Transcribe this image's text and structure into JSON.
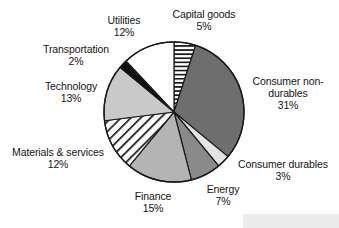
{
  "chart_data": {
    "type": "pie",
    "title": "",
    "subtitle": "",
    "xlabel": "",
    "ylabel": "",
    "grid": false,
    "legend_position": "none",
    "label_format": "name + percent outside slice",
    "start_angle_deg": 0,
    "direction": "clockwise",
    "categories": [
      "Capital goods",
      "Consumer non-durables",
      "Consumer durables",
      "Energy",
      "Finance",
      "Materials & services",
      "Technology",
      "Transportation",
      "Utilities"
    ],
    "values": [
      5,
      31,
      3,
      7,
      15,
      12,
      13,
      2,
      12
    ],
    "units": "%",
    "slices": [
      {
        "name": "Capital goods",
        "label_line1": "Capital goods",
        "label_line2": "5%",
        "value": 5,
        "fill": "horizontal-stripes",
        "color": "#ffffff",
        "stripe_color": "#1a1a1a"
      },
      {
        "name": "Consumer non-durables",
        "label_line1": "Consumer non-",
        "label_line2": "durables",
        "label_line3": "31%",
        "value": 31,
        "fill": "solid",
        "color": "#6e6e6e"
      },
      {
        "name": "Consumer durables",
        "label_line1": "Consumer durables",
        "label_line2": "3%",
        "value": 3,
        "fill": "solid",
        "color": "#e3e3e3"
      },
      {
        "name": "Energy",
        "label_line1": "Energy",
        "label_line2": "7%",
        "value": 7,
        "fill": "solid",
        "color": "#8a8a8a"
      },
      {
        "name": "Finance",
        "label_line1": "Finance",
        "label_line2": "15%",
        "value": 15,
        "fill": "solid",
        "color": "#b4b4b4"
      },
      {
        "name": "Materials & services",
        "label_line1": "Materials & services",
        "label_line2": "12%",
        "value": 12,
        "fill": "diagonal-hatch",
        "color": "#ffffff",
        "stripe_color": "#1a1a1a"
      },
      {
        "name": "Technology",
        "label_line1": "Technology",
        "label_line2": "13%",
        "value": 13,
        "fill": "solid",
        "color": "#c9c9c9"
      },
      {
        "name": "Transportation",
        "label_line1": "Transportation",
        "label_line2": "2%",
        "value": 2,
        "fill": "solid",
        "color": "#101010"
      },
      {
        "name": "Utilities",
        "label_line1": "Utilities",
        "label_line2": "12%",
        "value": 12,
        "fill": "solid",
        "color": "#ffffff"
      }
    ],
    "total": 100,
    "background_color": "#ffffff",
    "outline_color": "#1a1a1a"
  },
  "labels": {
    "capital_goods": {
      "name": "Capital goods",
      "value": "5%"
    },
    "consumer_nondurables": {
      "line1": "Consumer non-",
      "line2": "durables",
      "value": "31%"
    },
    "consumer_durables": {
      "name": "Consumer durables",
      "value": "3%"
    },
    "energy": {
      "name": "Energy",
      "value": "7%"
    },
    "finance": {
      "name": "Finance",
      "value": "15%"
    },
    "materials": {
      "name": "Materials & services",
      "value": "12%"
    },
    "technology": {
      "name": "Technology",
      "value": "13%"
    },
    "transportation": {
      "name": "Transportation",
      "value": "2%"
    },
    "utilities": {
      "name": "Utilities",
      "value": "12%"
    }
  }
}
